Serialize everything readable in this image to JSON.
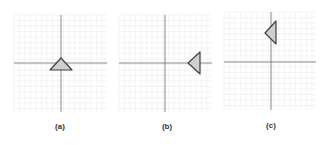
{
  "figure": {
    "colors": {
      "grid": "#ececec",
      "axis": "#7a7a7a",
      "triangle_fill": "#cfcfcf",
      "triangle_stroke": "#404040",
      "caption": "#333333"
    },
    "panels": [
      {
        "id": "a",
        "caption": "(a)",
        "grid": {
          "x": 14,
          "y": 15,
          "w": 93,
          "h": 97
        },
        "axes": {
          "cx": 61,
          "cy": 63
        },
        "triangle": {
          "orientation": "pointing-up",
          "points": "61,58 50,70 72,70"
        },
        "caption_pos": {
          "x": 60,
          "y": 122
        }
      },
      {
        "id": "b",
        "caption": "(b)",
        "grid": {
          "x": 119,
          "y": 15,
          "w": 93,
          "h": 97
        },
        "axes": {
          "cx": 165,
          "cy": 63
        },
        "triangle": {
          "orientation": "pointing-left",
          "points": "188,63 200,52 200,74"
        },
        "caption_pos": {
          "x": 167,
          "y": 122
        }
      },
      {
        "id": "c",
        "caption": "(c)",
        "grid": {
          "x": 224,
          "y": 12,
          "w": 92,
          "h": 98
        },
        "axes": {
          "cx": 271,
          "cy": 62
        },
        "triangle": {
          "orientation": "pointing-left",
          "points": "265,33 276,21 276,44"
        },
        "caption_pos": {
          "x": 271,
          "y": 121
        }
      }
    ]
  }
}
